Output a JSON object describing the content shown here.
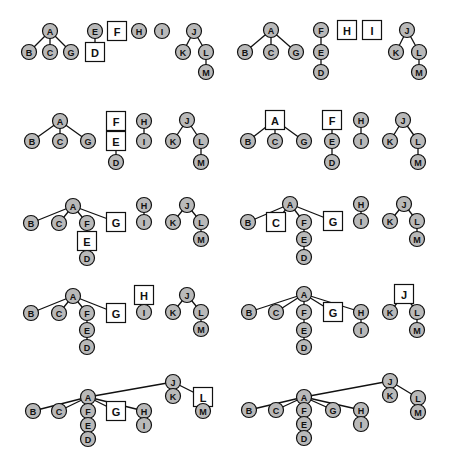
{
  "colors": {
    "node_fill": "#b9b9b9",
    "highlight_fill": "#ffffff",
    "stroke": "#111111"
  },
  "caption": "",
  "panels": [
    {
      "id": 1,
      "highlighted": [
        "D",
        "F"
      ],
      "nodes": [
        {
          "id": "A",
          "x": 50,
          "y": 31
        },
        {
          "id": "B",
          "x": 29,
          "y": 52
        },
        {
          "id": "C",
          "x": 50,
          "y": 52
        },
        {
          "id": "G",
          "x": 71,
          "y": 52
        },
        {
          "id": "E",
          "x": 95,
          "y": 31
        },
        {
          "id": "D",
          "x": 95,
          "y": 52
        },
        {
          "id": "F",
          "x": 117,
          "y": 31
        },
        {
          "id": "H",
          "x": 139,
          "y": 31
        },
        {
          "id": "I",
          "x": 162,
          "y": 31
        },
        {
          "id": "J",
          "x": 194,
          "y": 31
        },
        {
          "id": "K",
          "x": 183,
          "y": 52
        },
        {
          "id": "L",
          "x": 206,
          "y": 52
        },
        {
          "id": "M",
          "x": 206,
          "y": 72
        }
      ],
      "edges": [
        [
          "A",
          "B"
        ],
        [
          "A",
          "C"
        ],
        [
          "A",
          "G"
        ],
        [
          "E",
          "D"
        ],
        [
          "J",
          "K"
        ],
        [
          "J",
          "L"
        ],
        [
          "L",
          "M"
        ]
      ]
    },
    {
      "id": 2,
      "highlighted": [
        "H",
        "I"
      ],
      "nodes": [
        {
          "id": "A",
          "x": 271,
          "y": 30
        },
        {
          "id": "B",
          "x": 245,
          "y": 52
        },
        {
          "id": "C",
          "x": 271,
          "y": 52
        },
        {
          "id": "G",
          "x": 296,
          "y": 52
        },
        {
          "id": "F",
          "x": 321,
          "y": 30
        },
        {
          "id": "E",
          "x": 321,
          "y": 52
        },
        {
          "id": "D",
          "x": 321,
          "y": 72
        },
        {
          "id": "H",
          "x": 347,
          "y": 30
        },
        {
          "id": "I",
          "x": 372,
          "y": 30
        },
        {
          "id": "J",
          "x": 407,
          "y": 30
        },
        {
          "id": "K",
          "x": 396,
          "y": 52
        },
        {
          "id": "L",
          "x": 419,
          "y": 52
        },
        {
          "id": "M",
          "x": 419,
          "y": 72
        }
      ],
      "edges": [
        [
          "A",
          "B"
        ],
        [
          "A",
          "C"
        ],
        [
          "A",
          "G"
        ],
        [
          "F",
          "E"
        ],
        [
          "E",
          "D"
        ],
        [
          "J",
          "K"
        ],
        [
          "J",
          "L"
        ],
        [
          "L",
          "M"
        ]
      ]
    },
    {
      "id": 3,
      "highlighted": [
        "F",
        "E"
      ],
      "nodes": [
        {
          "id": "A",
          "x": 60,
          "y": 121
        },
        {
          "id": "B",
          "x": 32,
          "y": 141
        },
        {
          "id": "C",
          "x": 60,
          "y": 141
        },
        {
          "id": "G",
          "x": 88,
          "y": 141
        },
        {
          "id": "F",
          "x": 116,
          "y": 121
        },
        {
          "id": "E",
          "x": 116,
          "y": 141
        },
        {
          "id": "D",
          "x": 116,
          "y": 162
        },
        {
          "id": "H",
          "x": 144,
          "y": 121
        },
        {
          "id": "I",
          "x": 144,
          "y": 141
        },
        {
          "id": "J",
          "x": 187,
          "y": 120
        },
        {
          "id": "K",
          "x": 173,
          "y": 141
        },
        {
          "id": "L",
          "x": 201,
          "y": 141
        },
        {
          "id": "M",
          "x": 201,
          "y": 162
        }
      ],
      "edges": [
        [
          "A",
          "B"
        ],
        [
          "A",
          "C"
        ],
        [
          "A",
          "G"
        ],
        [
          "F",
          "E"
        ],
        [
          "E",
          "D"
        ],
        [
          "H",
          "I"
        ],
        [
          "J",
          "K"
        ],
        [
          "J",
          "L"
        ],
        [
          "L",
          "M"
        ]
      ]
    },
    {
      "id": 4,
      "highlighted": [
        "A",
        "F"
      ],
      "nodes": [
        {
          "id": "A",
          "x": 275,
          "y": 120
        },
        {
          "id": "B",
          "x": 248,
          "y": 141
        },
        {
          "id": "C",
          "x": 275,
          "y": 141
        },
        {
          "id": "G",
          "x": 304,
          "y": 141
        },
        {
          "id": "F",
          "x": 332,
          "y": 120
        },
        {
          "id": "E",
          "x": 332,
          "y": 141
        },
        {
          "id": "D",
          "x": 332,
          "y": 162
        },
        {
          "id": "H",
          "x": 361,
          "y": 120
        },
        {
          "id": "I",
          "x": 361,
          "y": 141
        },
        {
          "id": "J",
          "x": 403,
          "y": 120
        },
        {
          "id": "K",
          "x": 390,
          "y": 141
        },
        {
          "id": "L",
          "x": 418,
          "y": 141
        },
        {
          "id": "M",
          "x": 418,
          "y": 162
        }
      ],
      "edges": [
        [
          "A",
          "B"
        ],
        [
          "A",
          "C"
        ],
        [
          "A",
          "G"
        ],
        [
          "F",
          "E"
        ],
        [
          "E",
          "D"
        ],
        [
          "H",
          "I"
        ],
        [
          "J",
          "K"
        ],
        [
          "J",
          "L"
        ],
        [
          "L",
          "M"
        ]
      ]
    },
    {
      "id": 5,
      "highlighted": [
        "G",
        "E"
      ],
      "nodes": [
        {
          "id": "A",
          "x": 73,
          "y": 206
        },
        {
          "id": "B",
          "x": 31,
          "y": 223
        },
        {
          "id": "C",
          "x": 59,
          "y": 223
        },
        {
          "id": "F",
          "x": 87,
          "y": 223
        },
        {
          "id": "G",
          "x": 116,
          "y": 222
        },
        {
          "id": "E",
          "x": 87,
          "y": 241
        },
        {
          "id": "D",
          "x": 87,
          "y": 258
        },
        {
          "id": "H",
          "x": 144,
          "y": 205
        },
        {
          "id": "I",
          "x": 144,
          "y": 222
        },
        {
          "id": "J",
          "x": 187,
          "y": 205
        },
        {
          "id": "K",
          "x": 173,
          "y": 222
        },
        {
          "id": "L",
          "x": 201,
          "y": 222
        },
        {
          "id": "M",
          "x": 201,
          "y": 239
        }
      ],
      "edges": [
        [
          "A",
          "B"
        ],
        [
          "A",
          "C"
        ],
        [
          "A",
          "F"
        ],
        [
          "A",
          "G"
        ],
        [
          "F",
          "E"
        ],
        [
          "E",
          "D"
        ],
        [
          "H",
          "I"
        ],
        [
          "J",
          "K"
        ],
        [
          "J",
          "L"
        ],
        [
          "L",
          "M"
        ]
      ]
    },
    {
      "id": 6,
      "highlighted": [
        "C",
        "G"
      ],
      "nodes": [
        {
          "id": "A",
          "x": 290,
          "y": 204
        },
        {
          "id": "B",
          "x": 248,
          "y": 222
        },
        {
          "id": "C",
          "x": 276,
          "y": 222
        },
        {
          "id": "F",
          "x": 304,
          "y": 222
        },
        {
          "id": "G",
          "x": 333,
          "y": 221
        },
        {
          "id": "E",
          "x": 304,
          "y": 239
        },
        {
          "id": "D",
          "x": 304,
          "y": 257
        },
        {
          "id": "H",
          "x": 361,
          "y": 204
        },
        {
          "id": "I",
          "x": 361,
          "y": 221
        },
        {
          "id": "J",
          "x": 404,
          "y": 204
        },
        {
          "id": "K",
          "x": 390,
          "y": 221
        },
        {
          "id": "L",
          "x": 417,
          "y": 221
        },
        {
          "id": "M",
          "x": 417,
          "y": 239
        }
      ],
      "edges": [
        [
          "A",
          "B"
        ],
        [
          "A",
          "C"
        ],
        [
          "A",
          "F"
        ],
        [
          "A",
          "G"
        ],
        [
          "F",
          "E"
        ],
        [
          "E",
          "D"
        ],
        [
          "H",
          "I"
        ],
        [
          "J",
          "K"
        ],
        [
          "J",
          "L"
        ],
        [
          "L",
          "M"
        ]
      ]
    },
    {
      "id": 7,
      "highlighted": [
        "G",
        "H"
      ],
      "nodes": [
        {
          "id": "A",
          "x": 73,
          "y": 296
        },
        {
          "id": "B",
          "x": 31,
          "y": 313
        },
        {
          "id": "C",
          "x": 59,
          "y": 313
        },
        {
          "id": "F",
          "x": 87,
          "y": 313
        },
        {
          "id": "G",
          "x": 116,
          "y": 313
        },
        {
          "id": "E",
          "x": 87,
          "y": 330
        },
        {
          "id": "D",
          "x": 87,
          "y": 347
        },
        {
          "id": "H",
          "x": 144,
          "y": 295
        },
        {
          "id": "I",
          "x": 144,
          "y": 312
        },
        {
          "id": "J",
          "x": 187,
          "y": 295
        },
        {
          "id": "K",
          "x": 173,
          "y": 312
        },
        {
          "id": "L",
          "x": 201,
          "y": 312
        },
        {
          "id": "M",
          "x": 201,
          "y": 329
        }
      ],
      "edges": [
        [
          "A",
          "B"
        ],
        [
          "A",
          "C"
        ],
        [
          "A",
          "F"
        ],
        [
          "A",
          "G"
        ],
        [
          "F",
          "E"
        ],
        [
          "E",
          "D"
        ],
        [
          "H",
          "I"
        ],
        [
          "J",
          "K"
        ],
        [
          "J",
          "L"
        ],
        [
          "L",
          "M"
        ]
      ]
    },
    {
      "id": 8,
      "highlighted": [
        "G",
        "J"
      ],
      "nodes": [
        {
          "id": "A",
          "x": 304,
          "y": 294
        },
        {
          "id": "B",
          "x": 249,
          "y": 312
        },
        {
          "id": "C",
          "x": 276,
          "y": 312
        },
        {
          "id": "F",
          "x": 304,
          "y": 312
        },
        {
          "id": "G",
          "x": 333,
          "y": 312
        },
        {
          "id": "H",
          "x": 361,
          "y": 312
        },
        {
          "id": "E",
          "x": 304,
          "y": 330
        },
        {
          "id": "D",
          "x": 304,
          "y": 347
        },
        {
          "id": "I",
          "x": 361,
          "y": 330
        },
        {
          "id": "J",
          "x": 404,
          "y": 294
        },
        {
          "id": "K",
          "x": 390,
          "y": 312
        },
        {
          "id": "L",
          "x": 417,
          "y": 312
        },
        {
          "id": "M",
          "x": 417,
          "y": 330
        }
      ],
      "edges": [
        [
          "A",
          "B"
        ],
        [
          "A",
          "C"
        ],
        [
          "A",
          "F"
        ],
        [
          "A",
          "G"
        ],
        [
          "A",
          "H"
        ],
        [
          "F",
          "E"
        ],
        [
          "E",
          "D"
        ],
        [
          "H",
          "I"
        ],
        [
          "J",
          "K"
        ],
        [
          "J",
          "L"
        ],
        [
          "L",
          "M"
        ]
      ]
    },
    {
      "id": 9,
      "highlighted": [
        "G",
        "L"
      ],
      "nodes": [
        {
          "id": "J",
          "x": 173,
          "y": 382
        },
        {
          "id": "K",
          "x": 173,
          "y": 396
        },
        {
          "id": "L",
          "x": 203,
          "y": 397
        },
        {
          "id": "M",
          "x": 203,
          "y": 411
        },
        {
          "id": "A",
          "x": 88,
          "y": 397
        },
        {
          "id": "B",
          "x": 33,
          "y": 411
        },
        {
          "id": "C",
          "x": 59,
          "y": 411
        },
        {
          "id": "F",
          "x": 88,
          "y": 411
        },
        {
          "id": "G",
          "x": 116,
          "y": 411
        },
        {
          "id": "H",
          "x": 144,
          "y": 411
        },
        {
          "id": "E",
          "x": 88,
          "y": 425
        },
        {
          "id": "D",
          "x": 88,
          "y": 439
        },
        {
          "id": "I",
          "x": 144,
          "y": 425
        }
      ],
      "edges": [
        [
          "J",
          "A"
        ],
        [
          "J",
          "K"
        ],
        [
          "J",
          "L"
        ],
        [
          "L",
          "M"
        ],
        [
          "A",
          "B"
        ],
        [
          "A",
          "C"
        ],
        [
          "A",
          "F"
        ],
        [
          "A",
          "G"
        ],
        [
          "A",
          "H"
        ],
        [
          "F",
          "E"
        ],
        [
          "E",
          "D"
        ],
        [
          "H",
          "I"
        ]
      ]
    },
    {
      "id": 10,
      "highlighted": [],
      "nodes": [
        {
          "id": "J",
          "x": 390,
          "y": 381
        },
        {
          "id": "K",
          "x": 390,
          "y": 395
        },
        {
          "id": "L",
          "x": 418,
          "y": 398
        },
        {
          "id": "M",
          "x": 418,
          "y": 412
        },
        {
          "id": "A",
          "x": 304,
          "y": 397
        },
        {
          "id": "B",
          "x": 249,
          "y": 410
        },
        {
          "id": "C",
          "x": 276,
          "y": 410
        },
        {
          "id": "F",
          "x": 304,
          "y": 410
        },
        {
          "id": "G",
          "x": 333,
          "y": 410
        },
        {
          "id": "H",
          "x": 361,
          "y": 410
        },
        {
          "id": "E",
          "x": 304,
          "y": 424
        },
        {
          "id": "D",
          "x": 304,
          "y": 438
        },
        {
          "id": "I",
          "x": 361,
          "y": 424
        }
      ],
      "edges": [
        [
          "J",
          "A"
        ],
        [
          "J",
          "K"
        ],
        [
          "J",
          "L"
        ],
        [
          "L",
          "M"
        ],
        [
          "A",
          "B"
        ],
        [
          "A",
          "C"
        ],
        [
          "A",
          "F"
        ],
        [
          "A",
          "G"
        ],
        [
          "A",
          "H"
        ],
        [
          "F",
          "E"
        ],
        [
          "E",
          "D"
        ],
        [
          "H",
          "I"
        ]
      ]
    }
  ]
}
